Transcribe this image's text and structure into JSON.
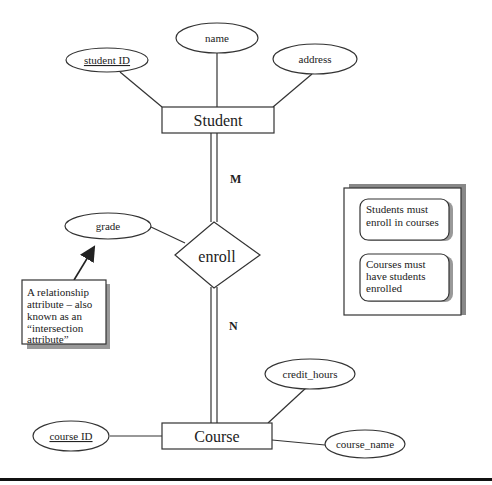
{
  "diagram": {
    "type": "ER diagram",
    "entities": [
      {
        "id": "student",
        "label": "Student"
      },
      {
        "id": "course",
        "label": "Course"
      }
    ],
    "relationship": {
      "id": "enroll",
      "label": "enroll"
    },
    "attributes": {
      "student_id": {
        "label": "student ID",
        "key": true
      },
      "name": {
        "label": "name"
      },
      "address": {
        "label": "address"
      },
      "grade": {
        "label": "grade"
      },
      "course_id": {
        "label": "course ID",
        "key": true
      },
      "credit_hours": {
        "label": "credit_hours"
      },
      "course_name": {
        "label": "course_name"
      }
    },
    "cardinality": {
      "student_side": "M",
      "course_side": "N"
    },
    "callout": {
      "lines": [
        "A relationship",
        "attribute – also",
        "known as an",
        "“intersection",
        "attribute”"
      ]
    },
    "constraints_box": {
      "note1": [
        "Students must",
        "enroll in courses"
      ],
      "note2": [
        "Courses must",
        "have students",
        "enrolled"
      ]
    }
  }
}
